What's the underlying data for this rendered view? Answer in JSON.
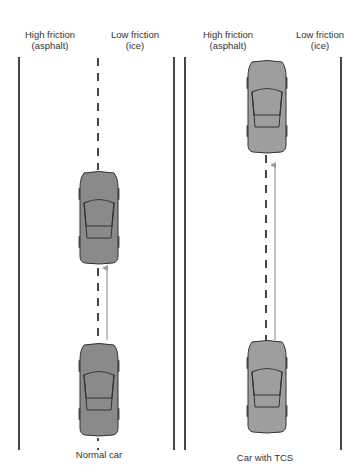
{
  "panels": [
    {
      "id": "normal",
      "caption": "Normal car",
      "lane_labels": [
        {
          "line1": "High friction",
          "line2": "(asphalt)"
        },
        {
          "line1": "Low friction",
          "line2": "(ice)"
        }
      ]
    },
    {
      "id": "tcs",
      "caption": "Car with TCS",
      "lane_labels": [
        {
          "line1": "High friction",
          "line2": "(asphalt)"
        },
        {
          "line1": "Low friction",
          "line2": "(ice)"
        }
      ]
    }
  ],
  "colors": {
    "road_line": "#1a1a1a",
    "car_body_normal": "#8a8a8a",
    "car_body_tcs": "#9e9e9e",
    "car_outline": "#333333",
    "arrow": "#999999"
  }
}
